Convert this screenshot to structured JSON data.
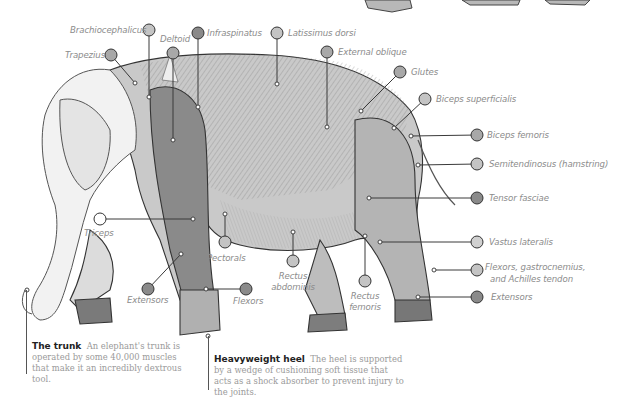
{
  "diagram": {
    "colors": {
      "dot_light": "#c4c4c4",
      "dot_mid": "#a8a8a8",
      "dot_dark": "#8a8a8a",
      "leader_line": "#3a3a3a",
      "label_text": "#8c8c8c",
      "caption_text": "#9a9a9a",
      "caption_heading": "#222222"
    },
    "labels": [
      {
        "id": "brachiocephalicus",
        "text": "Brachiocephalicus"
      },
      {
        "id": "trapezius",
        "text": "Trapezius"
      },
      {
        "id": "deltoid",
        "text": "Deltoid"
      },
      {
        "id": "infraspinatus",
        "text": "Infraspinatus"
      },
      {
        "id": "latissimus-dorsi",
        "text": "Latissimus dorsi"
      },
      {
        "id": "external-oblique",
        "text": "External oblique"
      },
      {
        "id": "glutes",
        "text": "Glutes"
      },
      {
        "id": "biceps-superficialis",
        "text": "Biceps superficialis"
      },
      {
        "id": "biceps-femoris",
        "text": "Biceps femoris"
      },
      {
        "id": "semitendinosus",
        "text": "Semitendinosus (hamstring)"
      },
      {
        "id": "tensor-fasciae",
        "text": "Tensor fasciae"
      },
      {
        "id": "vastus-lateralis",
        "text": "Vastus lateralis"
      },
      {
        "id": "flexors-hind-1",
        "text": "Flexors, gastrocnemius,"
      },
      {
        "id": "flexors-hind-2",
        "text": "and Achilles tendon"
      },
      {
        "id": "extensors-hind",
        "text": "Extensors"
      },
      {
        "id": "triceps",
        "text": "Triceps"
      },
      {
        "id": "pectorals",
        "text": "Pectorals"
      },
      {
        "id": "rectus-abdominis-1",
        "text": "Rectus"
      },
      {
        "id": "rectus-abdominis-2",
        "text": "abdominis"
      },
      {
        "id": "rectus-femoris-1",
        "text": "Rectus"
      },
      {
        "id": "rectus-femoris-2",
        "text": "femoris"
      },
      {
        "id": "extensors-fore",
        "text": "Extensors"
      },
      {
        "id": "flexors-fore",
        "text": "Flexors"
      }
    ],
    "captions": {
      "trunk": {
        "heading": "The trunk",
        "body": "An elephant's trunk is operated by some 40,000 muscles that make it an incredibly dextrous tool."
      },
      "heel": {
        "heading": "Heavyweight heel",
        "body": "The heel is supported by a wedge of cushioning soft tissue that acts as a shock absorber to prevent injury to the joints."
      }
    }
  }
}
